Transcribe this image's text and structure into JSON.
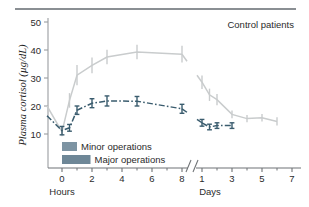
{
  "figure": {
    "top_rule": true,
    "annotation": "Control patients"
  },
  "chart_data": {
    "type": "line",
    "title": "Control patients",
    "xlabel_left": "Hours",
    "xlabel_right": "Days",
    "ylabel": "Plasma cortisol (µg/dL)",
    "ylim": [
      0,
      52
    ],
    "yticks": [
      10,
      20,
      30,
      40,
      50
    ],
    "ytick_labels": [
      "10",
      "20",
      "30",
      "40",
      "50"
    ],
    "xticks_hours": [
      0,
      2,
      4,
      6,
      8
    ],
    "xtick_labels_hours": [
      "0",
      "2",
      "4",
      "6",
      "8"
    ],
    "xticks_days": [
      1,
      3,
      5,
      7
    ],
    "xtick_labels_days": [
      "1",
      "3",
      "5",
      "7"
    ],
    "axis_break": true,
    "grid": false,
    "legend_position": "inside-lower-left",
    "series": [
      {
        "name": "Major operations",
        "color": "#c9cccd",
        "linestyle": "solid",
        "errorbars": true,
        "points": [
          {
            "x": -1,
            "unit": "hours",
            "y": 20.0,
            "err": 0.0
          },
          {
            "x": 0,
            "unit": "hours",
            "y": 10.8,
            "err": 1.6
          },
          {
            "x": 0.5,
            "unit": "hours",
            "y": 22.0,
            "err": 2.6
          },
          {
            "x": 1,
            "unit": "hours",
            "y": 31.0,
            "err": 3.6
          },
          {
            "x": 2,
            "unit": "hours",
            "y": 34.5,
            "err": 2.8
          },
          {
            "x": 3,
            "unit": "hours",
            "y": 37.5,
            "err": 2.6
          },
          {
            "x": 5,
            "unit": "hours",
            "y": 39.3,
            "err": 2.6
          },
          {
            "x": 8,
            "unit": "hours",
            "y": 38.5,
            "err": 3.0
          },
          {
            "x": 1,
            "unit": "days",
            "y": 28.5,
            "err": 2.4
          },
          {
            "x": 1.5,
            "unit": "days",
            "y": 24.0,
            "err": 2.2
          },
          {
            "x": 2,
            "unit": "days",
            "y": 22.3,
            "err": 2.0
          },
          {
            "x": 3,
            "unit": "days",
            "y": 17.0,
            "err": 1.4
          },
          {
            "x": 4,
            "unit": "days",
            "y": 15.5,
            "err": 1.3
          },
          {
            "x": 5,
            "unit": "days",
            "y": 15.8,
            "err": 1.3
          },
          {
            "x": 6,
            "unit": "days",
            "y": 14.5,
            "err": 1.5
          }
        ]
      },
      {
        "name": "Minor operations",
        "color": "#3a5c6e",
        "linestyle": "dashdot",
        "errorbars": true,
        "points": [
          {
            "x": -1,
            "unit": "hours",
            "y": 16.5,
            "err": 0.0
          },
          {
            "x": 0,
            "unit": "hours",
            "y": 11.2,
            "err": 1.5
          },
          {
            "x": 0.5,
            "unit": "hours",
            "y": 12.2,
            "err": 1.2
          },
          {
            "x": 1,
            "unit": "hours",
            "y": 18.5,
            "err": 1.5
          },
          {
            "x": 2,
            "unit": "hours",
            "y": 21.0,
            "err": 1.6
          },
          {
            "x": 3,
            "unit": "hours",
            "y": 21.8,
            "err": 1.8
          },
          {
            "x": 5,
            "unit": "hours",
            "y": 21.7,
            "err": 1.7
          },
          {
            "x": 8,
            "unit": "hours",
            "y": 19.0,
            "err": 1.6
          },
          {
            "x": 1,
            "unit": "days",
            "y": 14.0,
            "err": 1.2
          },
          {
            "x": 1.5,
            "unit": "days",
            "y": 12.5,
            "err": 1.0
          },
          {
            "x": 2,
            "unit": "days",
            "y": 13.0,
            "err": 1.0
          },
          {
            "x": 3,
            "unit": "days",
            "y": 13.0,
            "err": 1.0
          }
        ]
      }
    ],
    "operation_bars": [
      {
        "label": "Minor operations",
        "start_hours": 0,
        "end_hours": 1.0,
        "color": "#7d94a3"
      },
      {
        "label": "Major operations",
        "start_hours": 0,
        "end_hours": 1.9,
        "color": "#6e8797"
      }
    ]
  }
}
